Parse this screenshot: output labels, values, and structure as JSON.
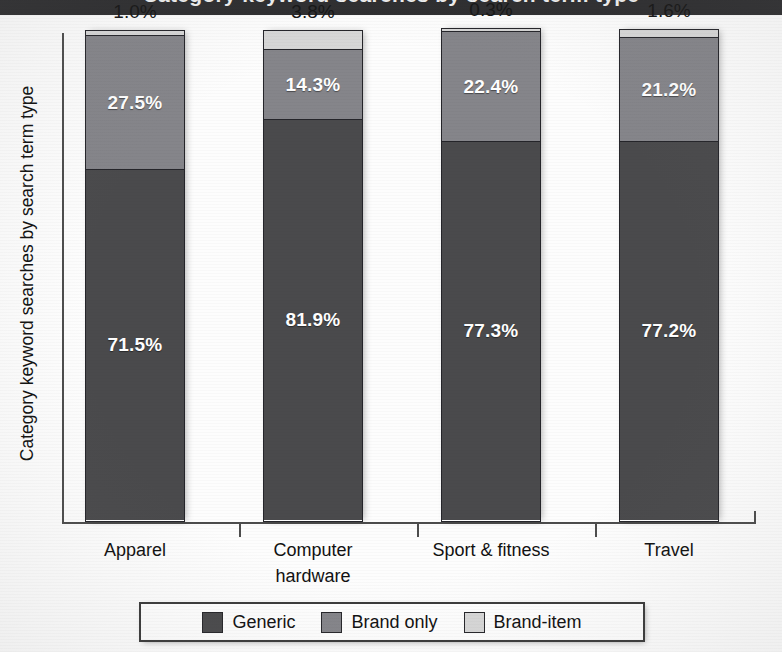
{
  "header": {
    "clipped_title": "Category keyword searches by search term type"
  },
  "chart_data": {
    "type": "bar",
    "stacked": true,
    "title": "",
    "xlabel": "",
    "ylabel": "Category keyword searches by search term type",
    "ylim": [
      0,
      100
    ],
    "grid": false,
    "legend_position": "bottom",
    "categories": [
      "Apparel",
      "Computer hardware",
      "Sport & fitness",
      "Travel"
    ],
    "category_lines": [
      {
        "line1": "Apparel",
        "line2": ""
      },
      {
        "line1": "Computer",
        "line2": "hardware"
      },
      {
        "line1": "Sport & fitness",
        "line2": ""
      },
      {
        "line1": "Travel",
        "line2": ""
      }
    ],
    "series": [
      {
        "name": "Generic",
        "color": "#4a4a4c",
        "values": [
          71.5,
          81.9,
          77.3,
          77.2
        ],
        "labels": [
          "71.5%",
          "81.9%",
          "77.3%",
          "77.2%"
        ]
      },
      {
        "name": "Brand only",
        "color": "#85858a",
        "values": [
          27.5,
          14.3,
          22.4,
          21.2
        ],
        "labels": [
          "27.5%",
          "14.3%",
          "22.4%",
          "21.2%"
        ]
      },
      {
        "name": "Brand-item",
        "color": "#d7d7d7",
        "values": [
          1.0,
          3.8,
          0.3,
          1.6
        ],
        "labels": [
          "1.0%",
          "3.8%",
          "0.3%",
          "1.6%"
        ]
      }
    ],
    "top_labels": [
      "1.0%",
      "3.8%",
      "0.3%",
      "1.6%"
    ]
  },
  "legend": {
    "items": [
      {
        "label": "Generic",
        "color": "#4a4a4c"
      },
      {
        "label": "Brand only",
        "color": "#85858a"
      },
      {
        "label": "Brand-item",
        "color": "#d7d7d7"
      }
    ]
  },
  "colors": {
    "generic": "#4a4a4c",
    "brand_only": "#85858a",
    "brand_item": "#d7d7d7",
    "axis": "#4d4d4d",
    "header_bar": "#2e2e30",
    "page": "#fdfdfd"
  }
}
